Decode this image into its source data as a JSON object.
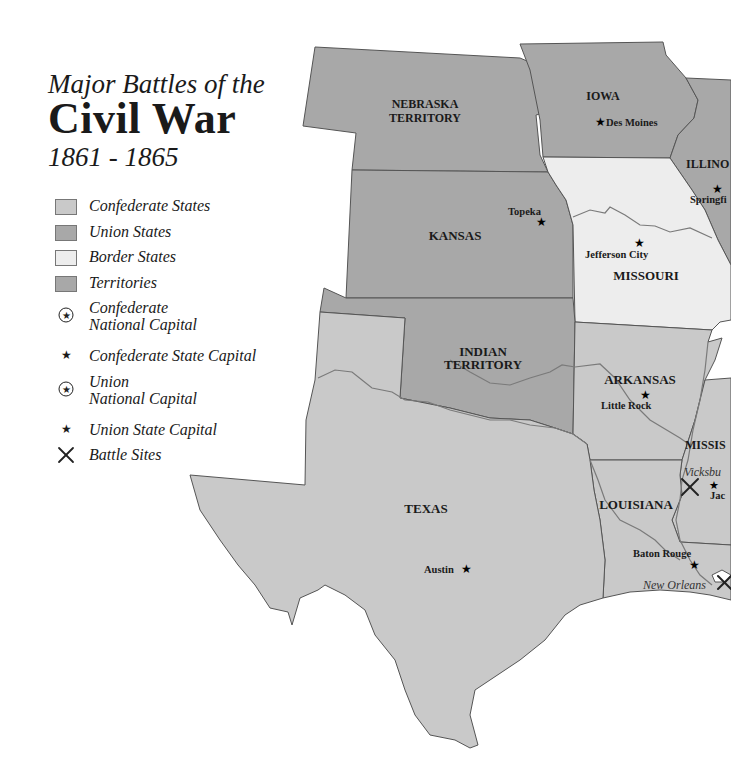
{
  "title": {
    "line1": "Major Battles of the",
    "line2": "Civil War",
    "line3": "1861 - 1865"
  },
  "colors": {
    "confederate": "#c9c9c9",
    "union": "#a8a8a8",
    "border": "#ededed",
    "territory": "#a8a8a8",
    "outline": "#555555",
    "river": "#7a7a7a"
  },
  "legend": {
    "items": [
      {
        "type": "swatch",
        "symbol": "confederate",
        "label": "Confederate States"
      },
      {
        "type": "swatch",
        "symbol": "union",
        "label": "Union States"
      },
      {
        "type": "swatch",
        "symbol": "border",
        "label": "Border States"
      },
      {
        "type": "swatch",
        "symbol": "territory",
        "label": "Territories"
      },
      {
        "type": "circled-star",
        "label_line1": "Confederate",
        "label_line2": "National Capital"
      },
      {
        "type": "star",
        "label": "Confederate State Capital"
      },
      {
        "type": "circled-star",
        "label_line1": "Union",
        "label_line2": "National Capital"
      },
      {
        "type": "star",
        "label": "Union State Capital"
      },
      {
        "type": "cross",
        "label": "Battle Sites"
      }
    ]
  },
  "map": {
    "regions": [
      {
        "name": "NEBRASKA TERRITORY",
        "line1": "NEBRASKA",
        "line2": "TERRITORY",
        "status": "territory"
      },
      {
        "name": "IOWA",
        "status": "union"
      },
      {
        "name": "ILLINOIS",
        "visible_label": "ILLINO",
        "status": "union"
      },
      {
        "name": "KANSAS",
        "status": "union"
      },
      {
        "name": "MISSOURI",
        "status": "border"
      },
      {
        "name": "INDIAN TERRITORY",
        "line1": "INDIAN",
        "line2": "TERRITORY",
        "status": "territory"
      },
      {
        "name": "ARKANSAS",
        "status": "confederate"
      },
      {
        "name": "TEXAS",
        "status": "confederate"
      },
      {
        "name": "LOUISIANA",
        "status": "confederate"
      },
      {
        "name": "MISSISSIPPI",
        "visible_label": "MISSIS",
        "status": "confederate"
      }
    ],
    "capitals": [
      {
        "name": "Des Moines",
        "type": "union-state-capital"
      },
      {
        "name": "Springfield",
        "visible_label": "Springfi",
        "type": "union-state-capital"
      },
      {
        "name": "Topeka",
        "type": "union-state-capital"
      },
      {
        "name": "Jefferson City",
        "type": "state-capital"
      },
      {
        "name": "Little Rock",
        "type": "confederate-state-capital"
      },
      {
        "name": "Austin",
        "type": "confederate-state-capital"
      },
      {
        "name": "Baton Rouge",
        "type": "confederate-state-capital"
      },
      {
        "name": "Jackson",
        "visible_label": "Jac",
        "type": "confederate-state-capital"
      }
    ],
    "battles": [
      {
        "name": "Vicksburg",
        "visible_label": "Vicksbu"
      },
      {
        "name": "New Orleans",
        "visible_label": "New Orleans"
      }
    ]
  }
}
